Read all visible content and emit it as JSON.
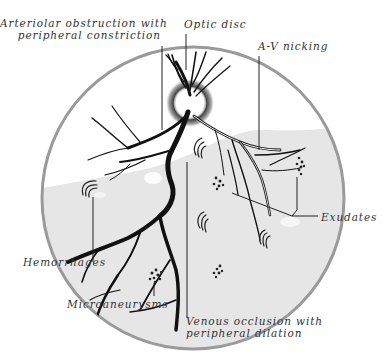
{
  "figure": {
    "colors": {
      "background": "#ffffff",
      "retina_fill": "#e6e6e6",
      "retina_rim": "#9a9a9a",
      "upper_clear_zone": "#ffffff",
      "vessels": "#111111",
      "leader_lines": "#222222",
      "label_text": "#333333"
    },
    "labels": {
      "arteriolar_line1": "Arteriolar obstruction with",
      "arteriolar_line2": "peripheral constriction",
      "optic_disc": "Optic disc",
      "av_nicking": "A-V nicking",
      "exudates": "Exudates",
      "hemorrhages": "Hemorrhages",
      "microaneurysms": "Microaneurysms",
      "venous_line1": "Venous occlusion with",
      "venous_line2": "peripheral dilation"
    }
  }
}
